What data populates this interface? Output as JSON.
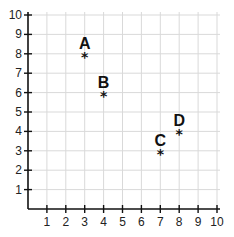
{
  "chart_data": {
    "type": "scatter",
    "title": "",
    "xlabel": "",
    "ylabel": "",
    "xlim": [
      0,
      10
    ],
    "ylim": [
      0,
      10
    ],
    "grid": true,
    "x_ticks": [
      1,
      2,
      3,
      4,
      5,
      6,
      7,
      8,
      9,
      10
    ],
    "y_ticks": [
      1,
      2,
      3,
      4,
      5,
      6,
      7,
      8,
      9,
      10
    ],
    "marker": "*",
    "points": [
      {
        "label": "A",
        "x": 3,
        "y": 8
      },
      {
        "label": "B",
        "x": 4,
        "y": 6
      },
      {
        "label": "C",
        "x": 7,
        "y": 3
      },
      {
        "label": "D",
        "x": 8,
        "y": 4
      }
    ]
  },
  "colors": {
    "axis": "#111111",
    "grid": "#d9d9d9",
    "text": "#222222"
  }
}
